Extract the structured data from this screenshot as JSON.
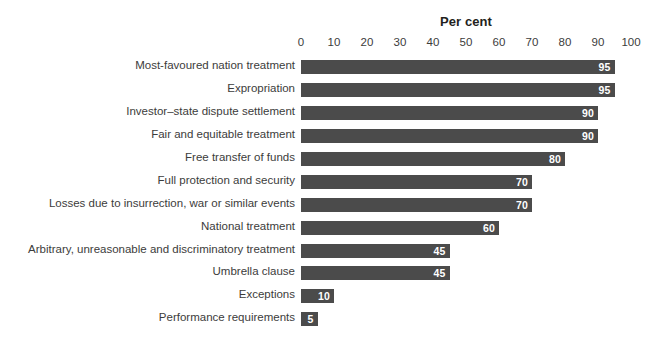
{
  "chart_data": {
    "type": "bar",
    "orientation": "horizontal",
    "title": "Per cent",
    "xlabel": "",
    "ylabel": "",
    "xlim": [
      0,
      100
    ],
    "xticks": [
      0,
      10,
      20,
      30,
      40,
      50,
      60,
      70,
      80,
      90,
      100
    ],
    "grid": false,
    "legend": null,
    "bar_color": "#4b4b4b",
    "value_label_color": "#ffffff",
    "categories": [
      "Most-favoured nation treatment",
      "Expropriation",
      "Investor–state dispute settlement",
      "Fair and equitable treatment",
      "Free transfer of funds",
      "Full protection and security",
      "Losses due to insurrection, war or similar events",
      "National treatment",
      "Arbitrary, unreasonable and discriminatory treatment",
      "Umbrella clause",
      "Exceptions",
      "Performance requirements"
    ],
    "values": [
      95,
      95,
      90,
      90,
      80,
      70,
      70,
      60,
      45,
      45,
      10,
      5
    ],
    "value_labels": [
      "95",
      "95",
      "90",
      "90",
      "80",
      "70",
      "70",
      "60",
      "45",
      "45",
      "10",
      "5"
    ]
  }
}
